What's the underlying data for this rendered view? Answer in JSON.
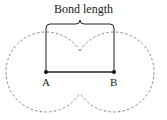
{
  "diagram": {
    "title": "Bond length",
    "atoms": [
      {
        "label": "A",
        "x": 46,
        "y": 72
      },
      {
        "label": "B",
        "x": 114,
        "y": 72
      }
    ],
    "atomic_radius_px": 40,
    "colors": {
      "line": "#222222",
      "dashed_outline": "#777777",
      "background": "#ffffff"
    }
  }
}
